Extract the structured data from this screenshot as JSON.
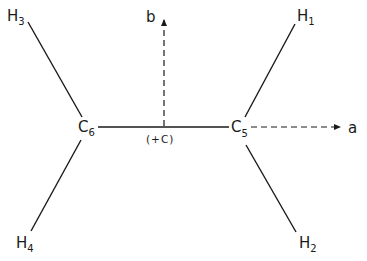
{
  "diagram": {
    "colors": {
      "ink": "#1a1a1a",
      "background": "#ffffff"
    },
    "atoms": [
      {
        "id": "C6",
        "symbol": "C",
        "subscript": "6"
      },
      {
        "id": "C5",
        "symbol": "C",
        "subscript": "5"
      },
      {
        "id": "H1",
        "symbol": "H",
        "subscript": "1"
      },
      {
        "id": "H2",
        "symbol": "H",
        "subscript": "2"
      },
      {
        "id": "H3",
        "symbol": "H",
        "subscript": "3"
      },
      {
        "id": "H4",
        "symbol": "H",
        "subscript": "4"
      }
    ],
    "bonds": [
      {
        "from": "C6",
        "to": "C5",
        "style": "solid"
      },
      {
        "from": "C6",
        "to": "H3",
        "style": "solid"
      },
      {
        "from": "C6",
        "to": "H4",
        "style": "solid"
      },
      {
        "from": "C5",
        "to": "H1",
        "style": "solid"
      },
      {
        "from": "C5",
        "to": "H2",
        "style": "solid"
      }
    ],
    "axes": [
      {
        "label": "a",
        "direction": "right",
        "style": "dashed-arrow"
      },
      {
        "label": "b",
        "direction": "up",
        "style": "dashed-arrow"
      }
    ],
    "center_label": "(+C)"
  }
}
